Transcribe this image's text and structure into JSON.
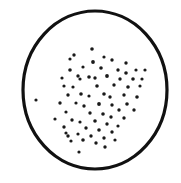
{
  "figure": {
    "type": "scatter",
    "caption": "",
    "background_color": "#ffffff",
    "ink_color": "#1a1a1a",
    "canvas": {
      "width": 181,
      "height": 183
    }
  },
  "field_boundary": {
    "shape": "circle",
    "center_x": 95,
    "center_y": 90,
    "radius_x": 72,
    "radius_y": 79,
    "stroke_color": "#111111",
    "stroke_width": 3.2,
    "fill_color": "#ffffff"
  },
  "chart_data": {
    "type": "scatter",
    "title": "",
    "xlabel": "",
    "ylabel": "",
    "grid": false,
    "legend": null,
    "xlim": [
      0,
      181
    ],
    "ylim": [
      0,
      183
    ],
    "point_color": "#1a1a1a",
    "point_radius": 1.7,
    "point_count": 71,
    "points": [
      {
        "x": 92,
        "y": 49,
        "r": 1.8
      },
      {
        "x": 74,
        "y": 55,
        "r": 1.7
      },
      {
        "x": 70,
        "y": 59,
        "r": 1.6
      },
      {
        "x": 104,
        "y": 57,
        "r": 1.6
      },
      {
        "x": 93,
        "y": 62,
        "r": 1.9
      },
      {
        "x": 112,
        "y": 60,
        "r": 1.7
      },
      {
        "x": 126,
        "y": 63,
        "r": 1.7
      },
      {
        "x": 70,
        "y": 70,
        "r": 1.8
      },
      {
        "x": 83,
        "y": 67,
        "r": 1.6
      },
      {
        "x": 101,
        "y": 68,
        "r": 1.8
      },
      {
        "x": 118,
        "y": 70,
        "r": 1.7
      },
      {
        "x": 136,
        "y": 70,
        "r": 1.6
      },
      {
        "x": 126,
        "y": 73,
        "r": 1.8
      },
      {
        "x": 145,
        "y": 70,
        "r": 1.6
      },
      {
        "x": 62,
        "y": 78,
        "r": 1.6
      },
      {
        "x": 78,
        "y": 76,
        "r": 1.7
      },
      {
        "x": 80,
        "y": 79,
        "r": 1.6
      },
      {
        "x": 89,
        "y": 77,
        "r": 1.8
      },
      {
        "x": 95,
        "y": 78,
        "r": 1.7
      },
      {
        "x": 107,
        "y": 76,
        "r": 1.9
      },
      {
        "x": 120,
        "y": 79,
        "r": 1.7
      },
      {
        "x": 133,
        "y": 79,
        "r": 1.8
      },
      {
        "x": 142,
        "y": 79,
        "r": 1.6
      },
      {
        "x": 64,
        "y": 86,
        "r": 1.6
      },
      {
        "x": 73,
        "y": 87,
        "r": 1.6
      },
      {
        "x": 97,
        "y": 86,
        "r": 1.8
      },
      {
        "x": 114,
        "y": 85,
        "r": 1.7
      },
      {
        "x": 128,
        "y": 87,
        "r": 1.8
      },
      {
        "x": 140,
        "y": 86,
        "r": 1.6
      },
      {
        "x": 36,
        "y": 100,
        "r": 1.6
      },
      {
        "x": 68,
        "y": 95,
        "r": 1.7
      },
      {
        "x": 81,
        "y": 94,
        "r": 1.8
      },
      {
        "x": 89,
        "y": 96,
        "r": 1.6
      },
      {
        "x": 104,
        "y": 94,
        "r": 1.8
      },
      {
        "x": 110,
        "y": 97,
        "r": 1.7
      },
      {
        "x": 124,
        "y": 95,
        "r": 1.7
      },
      {
        "x": 137,
        "y": 97,
        "r": 1.8
      },
      {
        "x": 60,
        "y": 103,
        "r": 1.7
      },
      {
        "x": 76,
        "y": 103,
        "r": 1.6
      },
      {
        "x": 84,
        "y": 106,
        "r": 1.7
      },
      {
        "x": 99,
        "y": 104,
        "r": 1.9
      },
      {
        "x": 112,
        "y": 105,
        "r": 1.7
      },
      {
        "x": 127,
        "y": 104,
        "r": 1.8
      },
      {
        "x": 119,
        "y": 110,
        "r": 1.7
      },
      {
        "x": 134,
        "y": 110,
        "r": 1.7
      },
      {
        "x": 66,
        "y": 112,
        "r": 1.6
      },
      {
        "x": 90,
        "y": 113,
        "r": 1.7
      },
      {
        "x": 103,
        "y": 114,
        "r": 1.8
      },
      {
        "x": 111,
        "y": 117,
        "r": 1.7
      },
      {
        "x": 124,
        "y": 118,
        "r": 1.7
      },
      {
        "x": 55,
        "y": 119,
        "r": 1.6
      },
      {
        "x": 72,
        "y": 120,
        "r": 1.7
      },
      {
        "x": 80,
        "y": 122,
        "r": 1.6
      },
      {
        "x": 95,
        "y": 121,
        "r": 1.8
      },
      {
        "x": 107,
        "y": 124,
        "r": 1.7
      },
      {
        "x": 118,
        "y": 126,
        "r": 1.6
      },
      {
        "x": 64,
        "y": 127,
        "r": 1.7
      },
      {
        "x": 86,
        "y": 128,
        "r": 1.7
      },
      {
        "x": 99,
        "y": 130,
        "r": 1.8
      },
      {
        "x": 112,
        "y": 132,
        "r": 1.7
      },
      {
        "x": 66,
        "y": 133,
        "r": 1.6
      },
      {
        "x": 68,
        "y": 136,
        "r": 1.7
      },
      {
        "x": 78,
        "y": 134,
        "r": 1.6
      },
      {
        "x": 91,
        "y": 136,
        "r": 1.7
      },
      {
        "x": 104,
        "y": 138,
        "r": 1.7
      },
      {
        "x": 71,
        "y": 141,
        "r": 1.6
      },
      {
        "x": 83,
        "y": 140,
        "r": 1.8
      },
      {
        "x": 96,
        "y": 143,
        "r": 1.7
      },
      {
        "x": 115,
        "y": 140,
        "r": 1.6
      },
      {
        "x": 105,
        "y": 147,
        "r": 1.7
      },
      {
        "x": 79,
        "y": 152,
        "r": 1.6
      }
    ]
  }
}
